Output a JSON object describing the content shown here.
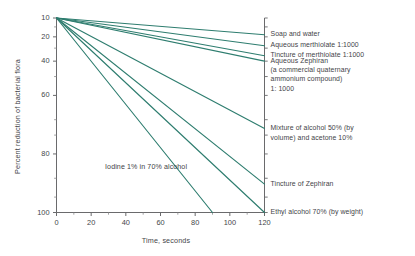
{
  "chart_data": {
    "type": "line",
    "title": "",
    "xlabel": "Time, seconds",
    "ylabel": "Percent reduction of bacterial flora",
    "xlim": [
      0,
      120
    ],
    "ylim": [
      10,
      100
    ],
    "yscale": "log",
    "grid": false,
    "legend_position": "right-of-axis-labels",
    "xticks": [
      0,
      20,
      40,
      60,
      80,
      100,
      120
    ],
    "xticklabels": [
      "0",
      "20",
      "40",
      "60",
      "80",
      "100",
      "120"
    ],
    "yticks": [
      10,
      20,
      40,
      60,
      80,
      100
    ],
    "yticklabels": [
      "10",
      "20",
      "40",
      "60",
      "80",
      "100"
    ],
    "line_color": "#2e7d6f",
    "annotations": [
      {
        "text": "Iodine 1% in 70% alcohol",
        "x": 28,
        "y": 17
      }
    ],
    "series": [
      {
        "name": "Soap and water",
        "x": [
          0,
          120
        ],
        "values": [
          100,
          82
        ]
      },
      {
        "name": "Aqueous merthiolate 1:1000",
        "x": [
          0,
          120
        ],
        "values": [
          100,
          72
        ]
      },
      {
        "name": "Tincture of merthiolate 1:1000",
        "x": [
          0,
          120
        ],
        "values": [
          100,
          64
        ]
      },
      {
        "name": "Aqueous Zephiran 1:1000",
        "x": [
          0,
          120
        ],
        "values": [
          100,
          60
        ]
      },
      {
        "name": "Mixture of alcohol 50% (by volume) and acetone 10%",
        "x": [
          0,
          120
        ],
        "values": [
          100,
          27
        ]
      },
      {
        "name": "Tincture of Zephiran",
        "x": [
          0,
          120
        ],
        "values": [
          100,
          14
        ]
      },
      {
        "name": "Ethyl alcohol 70% (by weight)",
        "x": [
          0,
          120
        ],
        "values": [
          100,
          10
        ]
      },
      {
        "name": "Iodine 1% in 70% alcohol",
        "x": [
          0,
          90
        ],
        "values": [
          100,
          10
        ]
      }
    ]
  },
  "axis": {
    "ylabel": "Percent reduction of bacterial flora",
    "xlabel": "Time, seconds",
    "ytick_labels": [
      "100",
      "80",
      "60",
      "40",
      "20",
      "10"
    ],
    "xtick_labels": [
      "0",
      "20",
      "40",
      "60",
      "80",
      "100",
      "120"
    ]
  },
  "right_labels": [
    {
      "lines": [
        "Soap and water"
      ]
    },
    {
      "lines": [
        "Aqueous merthiolate  1:1000"
      ]
    },
    {
      "lines": [
        "Tincture of merthiolate  1:1000"
      ]
    },
    {
      "lines": [
        "Aqueous Zephiran",
        "(a commercial  quaternary",
        "ammonium compound)",
        "1: 1000"
      ]
    },
    {
      "lines": [
        "Mixture of alcohol 50% (by",
        "volume) and acetone 10%"
      ]
    },
    {
      "lines": [
        "Tincture of Zephiran"
      ]
    },
    {
      "lines": [
        "Ethyl alcohol 70% (by weight)"
      ]
    }
  ],
  "annotation": {
    "iodine": "Iodine 1% in 70% alcohol"
  }
}
